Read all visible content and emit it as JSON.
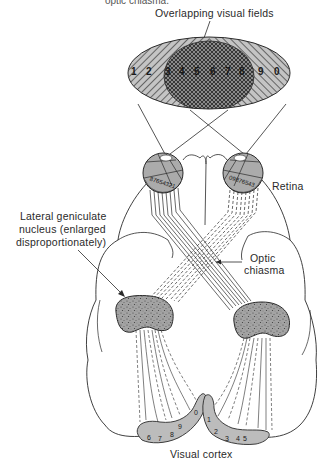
{
  "caption_fragment": "optic chiasma.",
  "labels": {
    "visual_fields": "Overlapping visual fields",
    "retina": "Retina",
    "lgn_line1": "Lateral geniculate",
    "lgn_line2": "nucleus (enlarged",
    "lgn_line3": "disproportionately)",
    "chiasma_line1": "Optic",
    "chiasma_line2": "chiasma",
    "cortex": "Visual cortex"
  },
  "visual_field_numbers": [
    "1",
    "2",
    "3",
    "4",
    "5",
    "6",
    "7",
    "8",
    "9",
    "0"
  ],
  "left_retina_numbers": "87654321",
  "right_retina_numbers": "09876543",
  "cortex_left_numbers": [
    "6",
    "7",
    "8",
    "9",
    "0"
  ],
  "cortex_right_numbers": [
    "1",
    "2",
    "3",
    "4",
    "5"
  ],
  "colors": {
    "ink": "#2a2a2a",
    "field_fill": "#b8b8b8",
    "overlap_fill": "#6e6e6e",
    "eye_fill": "#a9a9a9",
    "lgn_fill": "#9a9a9a",
    "cortex_fill": "#bcbcbc"
  }
}
